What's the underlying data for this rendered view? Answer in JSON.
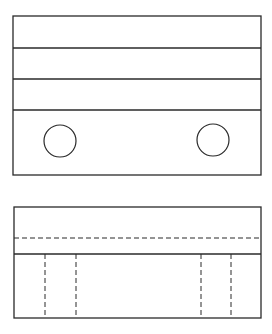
{
  "drawing": {
    "background": "#ffffff",
    "stroke": "#2a2a2a",
    "top_view": {
      "frame": {
        "x": 13,
        "y": 16,
        "w": 248,
        "h": 159
      },
      "horizontal_lines_y": [
        48,
        79,
        110
      ],
      "holes": [
        {
          "cx": 60,
          "cy": 141,
          "r": 16
        },
        {
          "cx": 213,
          "cy": 140,
          "r": 16
        }
      ]
    },
    "front_view": {
      "frame": {
        "x": 14,
        "y": 207,
        "w": 247,
        "h": 111
      },
      "hidden_line_horizontal_y": 238,
      "solid_line_y": 254,
      "hidden_lines_vertical_x": [
        45,
        76,
        201,
        231
      ]
    }
  }
}
